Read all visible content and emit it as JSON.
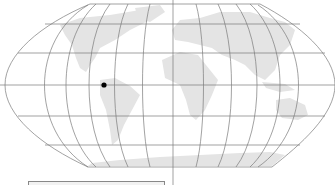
{
  "map": {
    "projection": "Robinson",
    "colors": {
      "land": "#e4e4e4",
      "graticule": "#7a7a7a",
      "marker": "#000000",
      "background": "#ffffff"
    },
    "marker": {
      "x": 104,
      "y": 85,
      "label": ""
    },
    "parallels_y": [
      4,
      24,
      53,
      85,
      116,
      145,
      167
    ],
    "central_meridian_x": 173
  },
  "inset": {
    "label": ""
  }
}
